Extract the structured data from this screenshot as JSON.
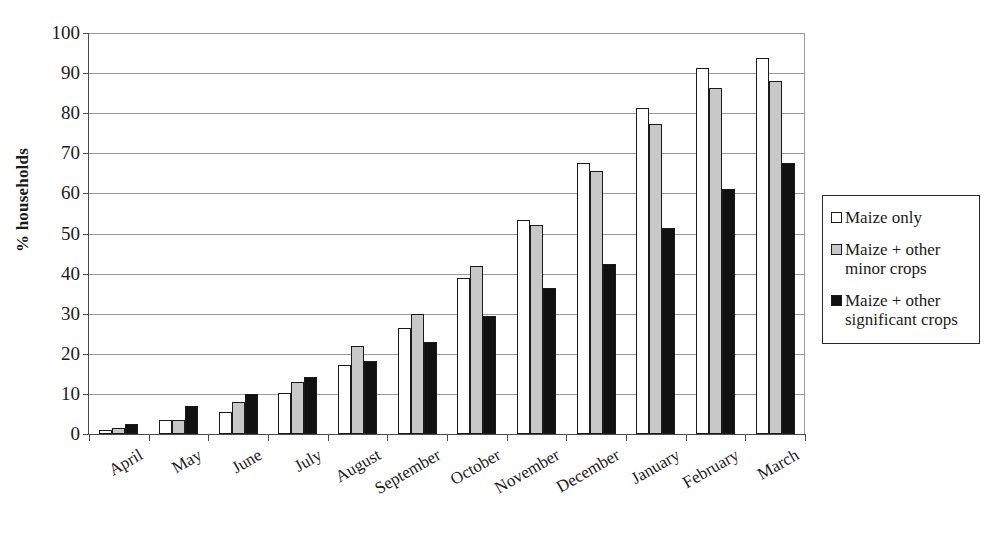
{
  "chart_data": {
    "type": "bar",
    "title": "",
    "xlabel": "",
    "ylabel": "% households",
    "ylim": [
      0,
      100
    ],
    "ytick_step": 10,
    "yticks": [
      0,
      10,
      20,
      30,
      40,
      50,
      60,
      70,
      80,
      90,
      100
    ],
    "grid": true,
    "legend_position": "right",
    "categories": [
      "April",
      "May",
      "June",
      "July",
      "August",
      "September",
      "October",
      "November",
      "December",
      "January",
      "February",
      "March"
    ],
    "series": [
      {
        "name": "Maize only",
        "color": "#ffffff",
        "values": [
          1.0,
          3.5,
          5.5,
          10.2,
          17.3,
          26.5,
          38.8,
          53.3,
          67.5,
          81.3,
          91.3,
          93.7
        ]
      },
      {
        "name": "Maize + other minor crops",
        "color": "#c8c8c8",
        "values": [
          1.4,
          3.4,
          8.0,
          13.0,
          22.0,
          30.0,
          41.8,
          52.2,
          65.5,
          77.3,
          86.2,
          88.0
        ]
      },
      {
        "name": "Maize + other significant crops",
        "color": "#111111",
        "values": [
          2.6,
          7.1,
          10.0,
          14.2,
          18.3,
          23.0,
          29.4,
          36.3,
          42.5,
          51.3,
          61.2,
          67.5
        ]
      }
    ]
  },
  "legend": {
    "items": [
      {
        "label": "Maize only"
      },
      {
        "label": "Maize + other minor crops"
      },
      {
        "label": "Maize + other significant crops"
      }
    ]
  }
}
